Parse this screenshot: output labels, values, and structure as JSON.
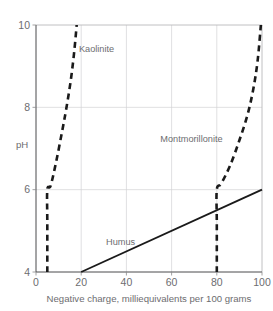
{
  "chart_data": {
    "type": "line",
    "title": "",
    "xlabel": "Negative charge, milliequivalents per 100 grams",
    "ylabel": "pH",
    "xlim": [
      0,
      100
    ],
    "ylim": [
      4,
      10
    ],
    "xticks": [
      0,
      20,
      40,
      60,
      80,
      100
    ],
    "yticks": [
      4,
      6,
      8,
      10
    ],
    "xtick_labels": [
      "0",
      "20",
      "40",
      "60",
      "80",
      "100"
    ],
    "ytick_labels": [
      "4",
      "6",
      "8",
      "10"
    ],
    "grid": true,
    "legend": "inline-labels",
    "series": [
      {
        "name": "Kaolinite",
        "style": "dashed",
        "color": "#1a1a1a",
        "label_x": 19,
        "label_ph": 9.35,
        "points": [
          {
            "x": 5,
            "ph": 4
          },
          {
            "x": 5,
            "ph": 5.2
          },
          {
            "x": 5,
            "ph": 6
          },
          {
            "x": 6.5,
            "ph": 6.1
          },
          {
            "x": 9,
            "ph": 6.7
          },
          {
            "x": 11.5,
            "ph": 7.4
          },
          {
            "x": 13.5,
            "ph": 8.0
          },
          {
            "x": 15.5,
            "ph": 8.7
          },
          {
            "x": 17,
            "ph": 9.4
          },
          {
            "x": 18,
            "ph": 10
          }
        ]
      },
      {
        "name": "Montmorillonite",
        "style": "dashed",
        "color": "#1a1a1a",
        "label_x": 55,
        "label_ph": 7.15,
        "points": [
          {
            "x": 80,
            "ph": 4
          },
          {
            "x": 80,
            "ph": 5.2
          },
          {
            "x": 80,
            "ph": 6
          },
          {
            "x": 82,
            "ph": 6.15
          },
          {
            "x": 86,
            "ph": 6.6
          },
          {
            "x": 90,
            "ph": 7.2
          },
          {
            "x": 93.5,
            "ph": 7.8
          },
          {
            "x": 96,
            "ph": 8.4
          },
          {
            "x": 98,
            "ph": 9.1
          },
          {
            "x": 99.5,
            "ph": 10
          }
        ]
      },
      {
        "name": "Humus",
        "style": "solid",
        "color": "#1a1a1a",
        "label_x": 31,
        "label_ph": 4.65,
        "points": [
          {
            "x": 20,
            "ph": 4
          },
          {
            "x": 100,
            "ph": 6
          }
        ]
      }
    ]
  },
  "axes": {
    "y_title": "pH",
    "x_title": "Negative charge, milliequivalents per 100 grams"
  },
  "labels": {
    "kaolinite": "Kaolinite",
    "montmorillonite": "Montmorillonite",
    "humus": "Humus"
  },
  "colors": {
    "curve": "#1a1a1a",
    "grid": "#d3d3d5",
    "text": "#6d6d70",
    "background": "#ffffff"
  }
}
